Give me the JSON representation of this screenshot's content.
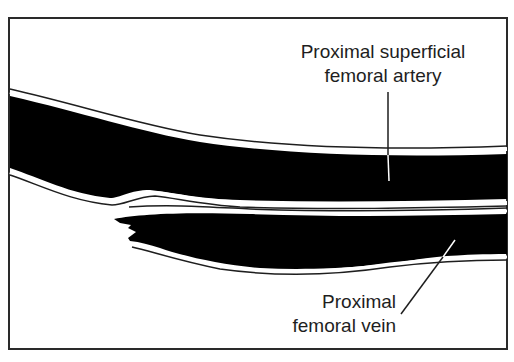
{
  "figure": {
    "type": "ultrasound-schematic",
    "labels": {
      "artery": {
        "line1": "Proximal superficial",
        "line2": "femoral artery"
      },
      "vein": {
        "line1": "Proximal",
        "line2": "femoral vein"
      }
    },
    "colors": {
      "vessel_lumen": "#000000",
      "background": "#ffffff",
      "outline": "#1e1e1e"
    }
  }
}
